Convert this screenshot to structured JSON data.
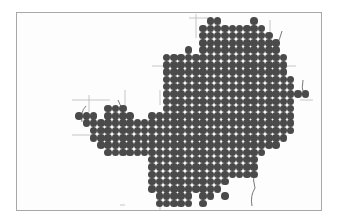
{
  "map": {
    "frame": {
      "x": 16,
      "y": 12,
      "w": 306,
      "h": 199,
      "border": "#a8a8a8"
    },
    "dot_color": "#4a4a4a",
    "grid": {
      "x0": 79,
      "y0": 21,
      "dx": 7.3,
      "dy": 7.3
    },
    "rows": [
      [
        [
          18,
          19
        ],
        [
          24,
          24
        ]
      ],
      [
        [
          17,
          21
        ],
        [
          22,
          25
        ]
      ],
      [
        [
          17,
          26
        ]
      ],
      [
        [
          17,
          27
        ]
      ],
      [
        [
          15,
          15
        ],
        [
          17,
          27
        ]
      ],
      [
        [
          12,
          28
        ]
      ],
      [
        [
          12,
          28
        ]
      ],
      [
        [
          12,
          28
        ]
      ],
      [
        [
          12,
          29
        ]
      ],
      [
        [
          12,
          29
        ]
      ],
      [
        [
          12,
          31
        ]
      ],
      [
        [
          12,
          29
        ]
      ],
      [
        [
          4,
          6
        ],
        [
          12,
          29
        ]
      ],
      [
        [
          0,
          2
        ],
        [
          4,
          7
        ],
        [
          10,
          29
        ]
      ],
      [
        [
          1,
          29
        ]
      ],
      [
        [
          2,
          29
        ]
      ],
      [
        [
          2,
          28
        ]
      ],
      [
        [
          3,
          27
        ]
      ],
      [
        [
          4,
          25
        ]
      ],
      [
        [
          10,
          24
        ]
      ],
      [
        [
          10,
          24
        ]
      ],
      [
        [
          10,
          24
        ]
      ],
      [
        [
          10,
          20
        ]
      ],
      [
        [
          10,
          19
        ]
      ],
      [
        [
          11,
          15
        ],
        [
          17,
          18
        ],
        [
          20,
          20
        ]
      ],
      [
        [
          11,
          15
        ],
        [
          17,
          17
        ]
      ]
    ],
    "grid_lines": [
      {
        "x1": 189,
        "y1": 18,
        "x2": 208,
        "y2": 18
      },
      {
        "x1": 196,
        "y1": 14,
        "x2": 196,
        "y2": 38
      },
      {
        "x1": 152,
        "y1": 66,
        "x2": 170,
        "y2": 66
      },
      {
        "x1": 72,
        "y1": 100,
        "x2": 110,
        "y2": 100
      },
      {
        "x1": 89,
        "y1": 95,
        "x2": 89,
        "y2": 112
      },
      {
        "x1": 72,
        "y1": 135,
        "x2": 95,
        "y2": 135
      },
      {
        "x1": 125,
        "y1": 90,
        "x2": 125,
        "y2": 108
      },
      {
        "x1": 160,
        "y1": 90,
        "x2": 160,
        "y2": 105
      },
      {
        "x1": 285,
        "y1": 66,
        "x2": 296,
        "y2": 66
      },
      {
        "x1": 300,
        "y1": 100,
        "x2": 313,
        "y2": 100
      },
      {
        "x1": 120,
        "y1": 205,
        "x2": 125,
        "y2": 205
      },
      {
        "x1": 160,
        "y1": 198,
        "x2": 160,
        "y2": 210
      },
      {
        "x1": 270,
        "y1": 20,
        "x2": 270,
        "y2": 35
      }
    ],
    "rivers": [
      "M282 31 Q280 40 276 45 Q279 50 275 55",
      "M118 100 Q122 108 124 115",
      "M86 106 Q80 112 82 122",
      "M303 80 Q301 88 304 95",
      "M255 172 Q252 180 255 188 Q250 196 252 206"
    ]
  }
}
